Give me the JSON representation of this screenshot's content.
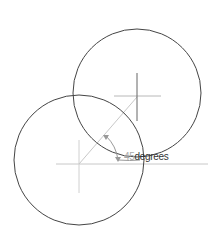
{
  "diagram": {
    "circles": [
      {
        "name": "left-circle",
        "cx": 79,
        "cy": 160,
        "r": 65,
        "color": "#444444"
      },
      {
        "name": "right-circle",
        "cx": 137,
        "cy": 93,
        "r": 64,
        "color": "#444444"
      }
    ],
    "angle_label": {
      "value": "45",
      "unit": "degrees"
    },
    "colors": {
      "construction": "#c8c8c8",
      "crosshair_dark": "#666666",
      "text_value": "#aaaaaa",
      "text_unit": "#333333"
    }
  }
}
